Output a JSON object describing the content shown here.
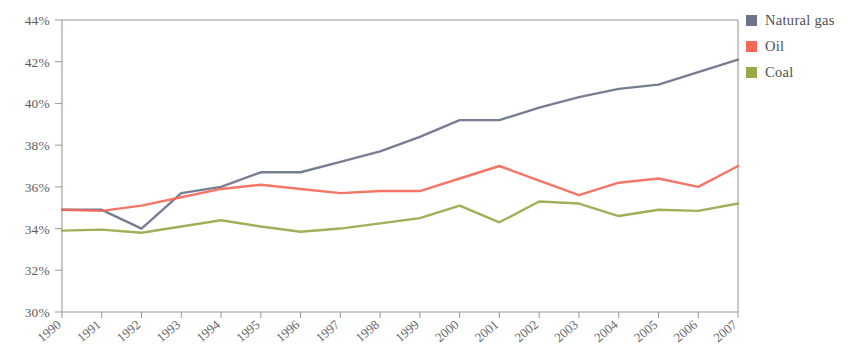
{
  "chart_data": {
    "type": "line",
    "title": "",
    "xlabel": "",
    "ylabel": "",
    "grid": false,
    "legend_position": "top-right",
    "x": [
      1990,
      1991,
      1992,
      1993,
      1994,
      1995,
      1996,
      1997,
      1998,
      1999,
      2000,
      2001,
      2002,
      2003,
      2004,
      2005,
      2006,
      2007
    ],
    "categories": [
      "1990",
      "1991",
      "1992",
      "1993",
      "1994",
      "1995",
      "1996",
      "1997",
      "1998",
      "1999",
      "2000",
      "2001",
      "2002",
      "2003",
      "2004",
      "2005",
      "2006",
      "2007"
    ],
    "ylim": [
      30,
      44
    ],
    "xlim": [
      1990,
      2007
    ],
    "ytick_labels": [
      "44%",
      "42%",
      "40%",
      "38%",
      "36%",
      "34%",
      "32%",
      "30%"
    ],
    "ytick_values": [
      44,
      42,
      40,
      38,
      36,
      34,
      32,
      30
    ],
    "series": [
      {
        "name": "Natural gas",
        "color": "#6d7389",
        "values": [
          34.9,
          34.9,
          34.0,
          35.7,
          36.0,
          36.7,
          36.7,
          37.2,
          37.7,
          38.4,
          39.2,
          39.2,
          39.8,
          40.3,
          40.7,
          40.9,
          41.5,
          42.1
        ]
      },
      {
        "name": "Oil",
        "color": "#f4695a",
        "values": [
          34.9,
          34.85,
          35.1,
          35.5,
          35.9,
          36.1,
          35.9,
          35.7,
          35.8,
          35.8,
          36.4,
          37.0,
          36.3,
          35.6,
          36.2,
          36.4,
          36.0,
          37.0
        ]
      },
      {
        "name": "Coal",
        "color": "#9aa84a",
        "values": [
          33.9,
          33.95,
          33.8,
          34.1,
          34.4,
          34.1,
          33.85,
          34.0,
          34.25,
          34.5,
          35.1,
          34.3,
          35.3,
          35.2,
          34.6,
          34.9,
          34.85,
          35.2
        ]
      }
    ]
  },
  "legend": {
    "items": [
      {
        "label": "Natural gas",
        "color": "#6d7389"
      },
      {
        "label": "Oil",
        "color": "#f4695a"
      },
      {
        "label": "Coal",
        "color": "#9aa84a"
      }
    ]
  }
}
